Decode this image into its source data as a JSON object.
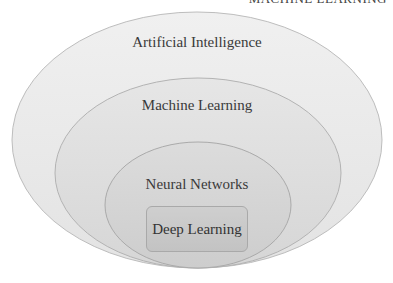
{
  "header": {
    "cutoff_text": "MACHINE LEARNING"
  },
  "diagram": {
    "type": "nested-ellipses",
    "layers": [
      {
        "label": "Artificial Intelligence",
        "fill": "#ececec",
        "stroke": "#bdbdbd"
      },
      {
        "label": "Machine Learning",
        "fill": "#e0e0e0",
        "stroke": "#b3b3b3"
      },
      {
        "label": "Neural Networks",
        "fill": "#d6d6d6",
        "stroke": "#aaaaaa"
      },
      {
        "label": "Deep Learning",
        "fill": "#c8c8c8",
        "stroke": "#a9a9a9"
      }
    ]
  }
}
